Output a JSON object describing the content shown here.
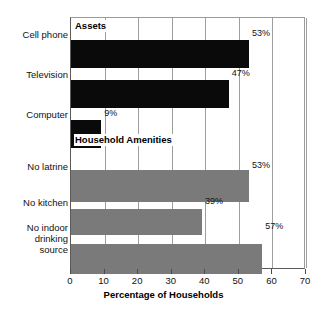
{
  "chart_data": {
    "type": "bar",
    "orientation": "horizontal",
    "title": "",
    "xlabel": "Percentage of Households",
    "ylabel": "",
    "xlim": [
      0,
      70
    ],
    "xticks": [
      0,
      10,
      20,
      30,
      40,
      50,
      60,
      70
    ],
    "grid": true,
    "legend": "none",
    "groups": [
      {
        "name": "Assets",
        "color": "#0a0a0a",
        "categories": [
          "Cell phone",
          "Television",
          "Computer"
        ],
        "values": [
          53,
          47,
          9
        ],
        "value_labels": [
          "53%",
          "47%",
          "9%"
        ]
      },
      {
        "name": "Household Amenities",
        "color": "#7a7a7a",
        "categories": [
          "No latrine",
          "No kitchen",
          "No indoor\ndrinking\nsource"
        ],
        "values": [
          53,
          39,
          57
        ],
        "value_labels": [
          "53%",
          "39%",
          "57%"
        ]
      }
    ],
    "categories": [
      "Cell phone",
      "Television",
      "Computer",
      "No latrine",
      "No kitchen",
      "No indoor drinking source"
    ],
    "values": [
      53,
      47,
      9,
      53,
      39,
      57
    ]
  },
  "bars": [
    {
      "label": "Cell phone",
      "display_label": "Cell phone",
      "value": 53,
      "value_label": "53%",
      "style": "assets",
      "top": 22,
      "height": 28,
      "label_top": 29
    },
    {
      "label": "Television",
      "display_label": "Television",
      "value": 47,
      "value_label": "47%",
      "style": "assets",
      "top": 62,
      "height": 28,
      "label_top": 69
    },
    {
      "label": "Computer",
      "display_label": "Computer",
      "value": 9,
      "value_label": "9%",
      "style": "assets",
      "top": 102,
      "height": 28,
      "label_top": 109
    },
    {
      "label": "No latrine",
      "display_label": "No latrine",
      "value": 53,
      "value_label": "53%",
      "style": "amenity",
      "top": 152,
      "height": 32,
      "label_top": 161
    },
    {
      "label": "No kitchen",
      "display_label": "No kitchen",
      "value": 39,
      "value_label": "39%",
      "style": "amenity",
      "top": 191,
      "height": 26,
      "label_top": 197
    },
    {
      "label": "No indoor drinking source",
      "display_label": "No indoor\ndrinking\nsource",
      "value": 57,
      "value_label": "57%",
      "style": "amenity",
      "top": 226,
      "height": 30,
      "label_top": 222
    }
  ],
  "sections": [
    {
      "name": "Assets",
      "top": 19
    },
    {
      "name": "Household Amenities",
      "top": 133
    }
  ],
  "axis": {
    "title": "Percentage of Households",
    "ticks": [
      "0",
      "10",
      "20",
      "30",
      "40",
      "50",
      "60",
      "70"
    ]
  },
  "colors": {
    "assets_bar": "#0a0a0a",
    "amenity_bar": "#7a7a7a",
    "gridline": "#9e9e9e",
    "axis": "#5a5a5a",
    "text": "#111111",
    "background": "#ffffff"
  }
}
